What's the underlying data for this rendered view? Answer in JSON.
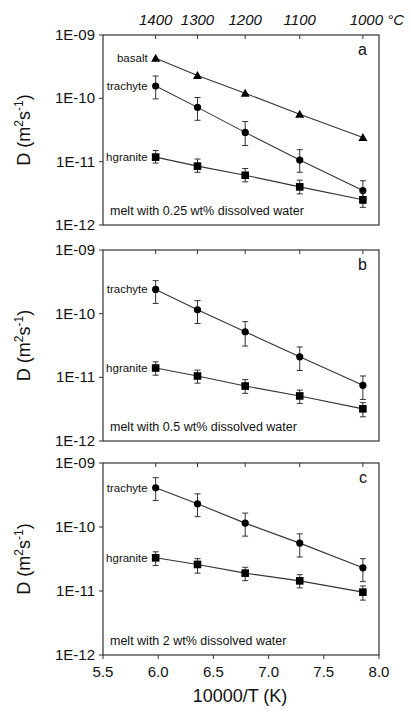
{
  "chart_data": {
    "type": "scatter",
    "xlabel": "10000/T (K)",
    "ylabel": "D (m²s⁻¹)",
    "xlim": [
      5.5,
      8.0
    ],
    "x_ticks": [
      "5.5",
      "6.0",
      "6.5",
      "7.0",
      "7.5",
      "8.0"
    ],
    "x_tick_values": [
      5.5,
      6.0,
      6.5,
      7.0,
      7.5,
      8.0
    ],
    "y_scale": "log",
    "ylim": [
      1e-12,
      1e-09
    ],
    "y_ticks": [
      "1E-09",
      "1E-10",
      "1E-11",
      "1E-12"
    ],
    "y_tick_values": [
      1e-09,
      1e-10,
      1e-11,
      1e-12
    ],
    "top_axis": {
      "labels": [
        "1400",
        "1300",
        "1200",
        "1100",
        "1000 °C"
      ],
      "celsius": [
        1400,
        1300,
        1200,
        1100,
        1000
      ]
    },
    "x": [
      5.977,
      6.356,
      6.788,
      7.282,
      7.854
    ],
    "panels": [
      {
        "letter": "a",
        "annotation": "melt with 0.25 wt% dissolved water",
        "series": [
          {
            "name": "basalt",
            "marker": "triangle",
            "values": [
              4.3e-10,
              2.3e-10,
              1.2e-10,
              5.6e-11,
              2.4e-11
            ],
            "err_low": null,
            "err_high": null
          },
          {
            "name": "trachyte",
            "marker": "circle",
            "values": [
              1.56e-10,
              7.2e-11,
              2.9e-11,
              1.06e-11,
              3.5e-12
            ],
            "err_low": [
              9.8e-11,
              4.5e-11,
              1.8e-11,
              6.8e-12,
              2.2e-12
            ],
            "err_high": [
              2.25e-10,
              1.03e-10,
              4.3e-11,
              1.55e-11,
              5e-12
            ]
          },
          {
            "name": "hgranite",
            "marker": "square",
            "values": [
              1.18e-11,
              8.5e-12,
              6.1e-12,
              4e-12,
              2.5e-12
            ],
            "err_low": [
              9.5e-12,
              6.8e-12,
              4.8e-12,
              3.1e-12,
              1.9e-12
            ],
            "err_high": [
              1.5e-11,
              1.1e-11,
              7.8e-12,
              5.1e-12,
              3.3e-12
            ]
          }
        ]
      },
      {
        "letter": "b",
        "annotation": "melt with 0.5 wt% dissolved water",
        "series": [
          {
            "name": "trachyte",
            "marker": "circle",
            "values": [
              2.4e-10,
              1.15e-10,
              5.2e-11,
              2.1e-11,
              7.5e-12
            ],
            "err_low": [
              1.45e-10,
              7e-11,
              3.1e-11,
              1.28e-11,
              4.5e-12
            ],
            "err_high": [
              3.3e-10,
              1.6e-10,
              7.5e-11,
              3e-11,
              1.05e-11
            ]
          },
          {
            "name": "hgranite",
            "marker": "square",
            "values": [
              1.4e-11,
              1.05e-11,
              7.3e-12,
              5.1e-12,
              3.2e-12
            ],
            "err_low": [
              1.08e-11,
              8.1e-12,
              5.6e-12,
              3.9e-12,
              2.4e-12
            ],
            "err_high": [
              1.75e-11,
              1.3e-11,
              9.2e-12,
              6.3e-12,
              4e-12
            ]
          }
        ]
      },
      {
        "letter": "c",
        "annotation": "melt with 2 wt% dissolved water",
        "series": [
          {
            "name": "trachyte",
            "marker": "circle",
            "values": [
              4.1e-10,
              2.3e-10,
              1.15e-10,
              5.6e-11,
              2.3e-11
            ],
            "err_low": [
              2.6e-10,
              1.45e-10,
              7.2e-11,
              3.4e-11,
              1.4e-11
            ],
            "err_high": [
              5.9e-10,
              3.3e-10,
              1.65e-10,
              7.8e-11,
              3.2e-11
            ]
          },
          {
            "name": "hgranite",
            "marker": "square",
            "values": [
              3.3e-11,
              2.6e-11,
              1.9e-11,
              1.44e-11,
              9.6e-12
            ],
            "err_low": [
              2.5e-11,
              1.9e-11,
              1.45e-11,
              1.12e-11,
              7.2e-12
            ],
            "err_high": [
              4.1e-11,
              3.2e-11,
              2.35e-11,
              1.8e-11,
              1.2e-11
            ]
          }
        ]
      }
    ]
  }
}
